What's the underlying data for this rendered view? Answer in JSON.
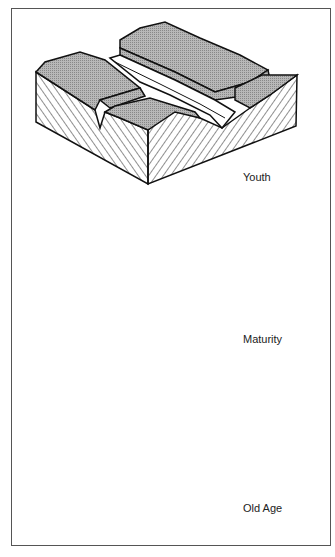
{
  "figure": {
    "stages": [
      {
        "label": "Youth"
      },
      {
        "label": "Maturity"
      },
      {
        "label": "Old Age"
      }
    ],
    "colors": {
      "upland_fill": "#a8a8a8",
      "valley_floor": "#ffffff",
      "outline": "#111111",
      "frame": "#555555"
    }
  }
}
